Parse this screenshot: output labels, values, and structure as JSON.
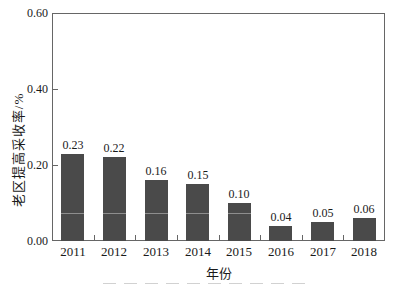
{
  "chart_data": {
    "type": "bar",
    "title": "",
    "categories": [
      "2011",
      "2012",
      "2013",
      "2014",
      "2015",
      "2016",
      "2017",
      "2018"
    ],
    "values": [
      0.23,
      0.22,
      0.16,
      0.15,
      0.1,
      0.04,
      0.05,
      0.06
    ],
    "value_labels": [
      "0.23",
      "0.22",
      "0.16",
      "0.15",
      "0.10",
      "0.04",
      "0.05",
      "0.06"
    ],
    "xlabel": "年份",
    "ylabel": "老区提高采收率/%",
    "ylim": [
      0,
      0.6
    ],
    "y_ticks": [
      "0.00",
      "0.20",
      "0.40",
      "0.60"
    ],
    "grid": "off",
    "legend": "none",
    "bar_color": "#4a4a4a",
    "frame_color": "#666666",
    "text_color": "#1a1a1a",
    "background_color": "#ffffff"
  }
}
